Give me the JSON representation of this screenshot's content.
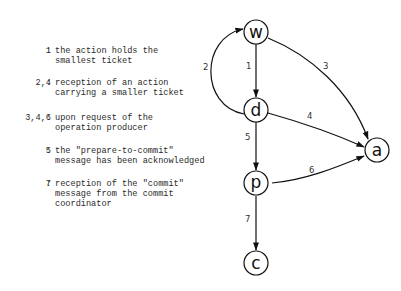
{
  "legend": [
    {
      "key": "1",
      "lines": [
        "the action holds the",
        "smallest ticket"
      ]
    },
    {
      "key": "2,4",
      "lines": [
        "reception of an action",
        "carrying a smaller ticket"
      ]
    },
    {
      "key": "3,4,6",
      "lines": [
        "upon request of the",
        "operation producer"
      ]
    },
    {
      "key": "5",
      "lines": [
        "the \"prepare-to-commit\"",
        "message has been acknowledged"
      ]
    },
    {
      "key": "7",
      "lines": [
        "reception of the \"commit\"",
        "message from the commit",
        "coordinator"
      ]
    }
  ],
  "separator": ":",
  "graph": {
    "nodes": [
      {
        "id": "w",
        "label": "w"
      },
      {
        "id": "d",
        "label": "d"
      },
      {
        "id": "p",
        "label": "p"
      },
      {
        "id": "c",
        "label": "c"
      },
      {
        "id": "a",
        "label": "a"
      }
    ],
    "edges": [
      {
        "from": "w",
        "to": "d",
        "label": "1"
      },
      {
        "from": "d",
        "to": "w",
        "label": "2"
      },
      {
        "from": "w",
        "to": "a",
        "label": "3"
      },
      {
        "from": "d",
        "to": "a",
        "label": "4"
      },
      {
        "from": "d",
        "to": "p",
        "label": "5"
      },
      {
        "from": "p",
        "to": "a",
        "label": "6"
      },
      {
        "from": "p",
        "to": "c",
        "label": "7"
      }
    ]
  }
}
